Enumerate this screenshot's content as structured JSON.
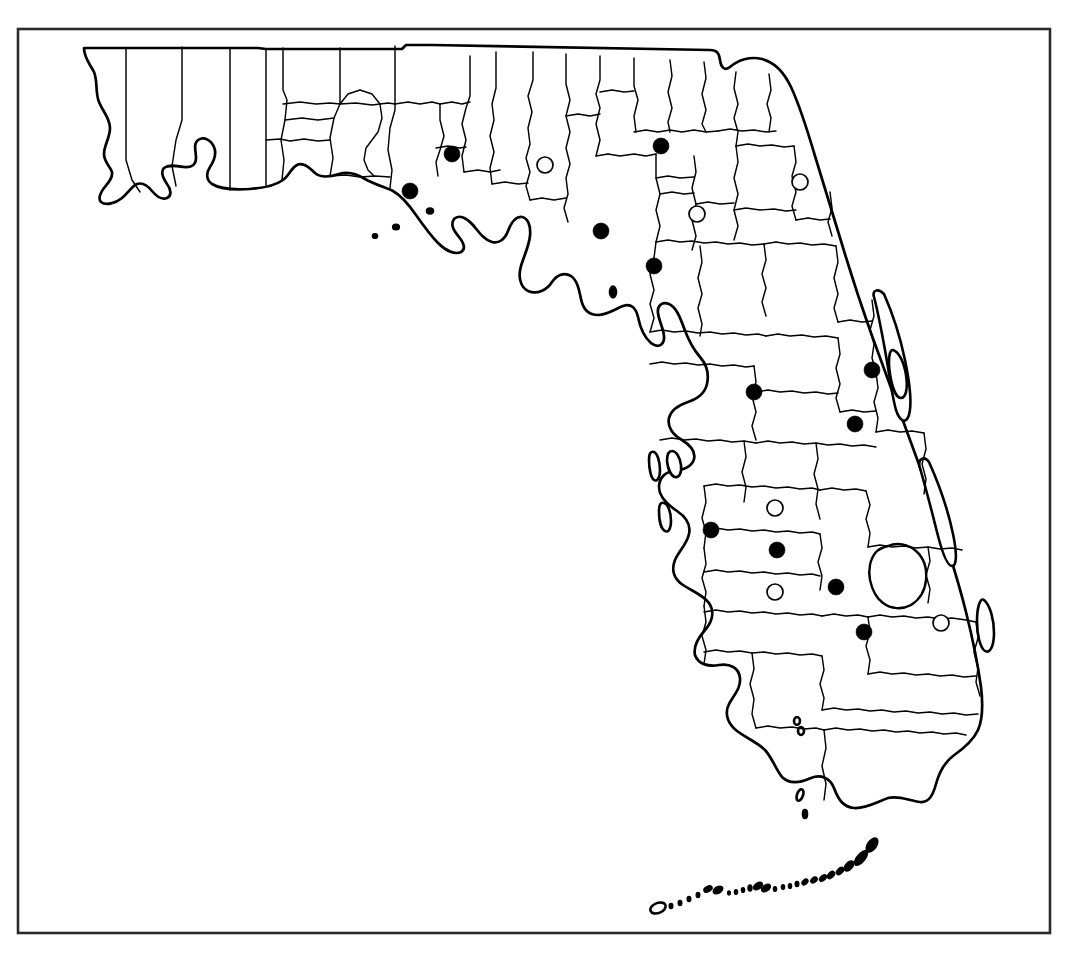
{
  "figure": {
    "kind": "distribution-map",
    "region": "Florida",
    "frame": {
      "x": 18,
      "y": 29,
      "width": 1032,
      "height": 904,
      "stroke": "#2b2b2b"
    },
    "background_color": "#ffffff",
    "outline_color": "#000000",
    "symbol_legend": [
      {
        "symbol": "filled-circle",
        "name": "filled-county-record",
        "fill": "#000000"
      },
      {
        "symbol": "open-circle",
        "name": "open-county-record",
        "fill": "#ffffff"
      }
    ]
  },
  "chart_data": {
    "type": "scatter",
    "title": "",
    "xlabel": "",
    "ylabel": "",
    "series": [
      {
        "name": "filled-circle",
        "symbol": "filled",
        "count": 15,
        "points": [
          {
            "id": "f1",
            "x": 452,
            "y": 154,
            "r": 8
          },
          {
            "id": "f2",
            "x": 410,
            "y": 191,
            "r": 8
          },
          {
            "id": "f3",
            "x": 661,
            "y": 146,
            "r": 8
          },
          {
            "id": "f4",
            "x": 601,
            "y": 231,
            "r": 8
          },
          {
            "id": "f5",
            "x": 654,
            "y": 266,
            "r": 8
          },
          {
            "id": "f6",
            "x": 872,
            "y": 370,
            "r": 8
          },
          {
            "id": "f7",
            "x": 754,
            "y": 392,
            "r": 8
          },
          {
            "id": "f8",
            "x": 855,
            "y": 424,
            "r": 8
          },
          {
            "id": "f9",
            "x": 711,
            "y": 530,
            "r": 8
          },
          {
            "id": "f10",
            "x": 777,
            "y": 550,
            "r": 8
          },
          {
            "id": "f11",
            "x": 836,
            "y": 587,
            "r": 8
          },
          {
            "id": "f12",
            "x": 864,
            "y": 632,
            "r": 8
          }
        ]
      },
      {
        "name": "open-circle",
        "symbol": "open",
        "count": 6,
        "points": [
          {
            "id": "o1",
            "x": 545,
            "y": 165,
            "r": 8
          },
          {
            "id": "o2",
            "x": 697,
            "y": 214,
            "r": 8
          },
          {
            "id": "o3",
            "x": 800,
            "y": 182,
            "r": 8
          },
          {
            "id": "o4",
            "x": 775,
            "y": 508,
            "r": 8
          },
          {
            "id": "o5",
            "x": 775,
            "y": 592,
            "r": 8
          },
          {
            "id": "o6",
            "x": 941,
            "y": 623,
            "r": 8
          }
        ]
      }
    ]
  }
}
